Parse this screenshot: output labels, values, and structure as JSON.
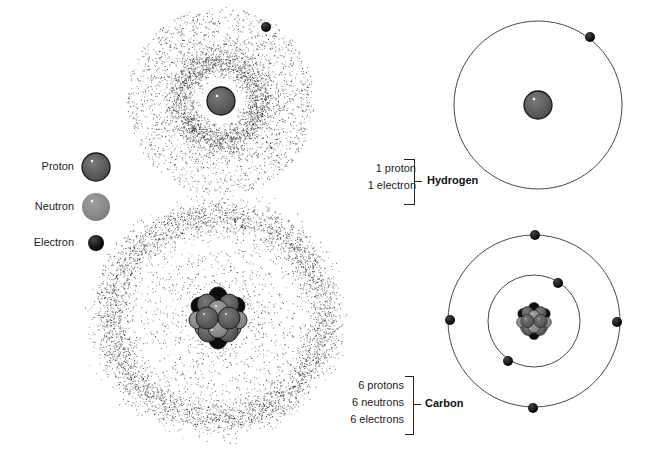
{
  "legend": {
    "items": [
      {
        "label": "Proton",
        "color": "#5a5a5a",
        "stroke": "#1a1a1a"
      },
      {
        "label": "Neutron",
        "color": "#8c8c8c",
        "stroke": "#8c8c8c"
      },
      {
        "label": "Electron",
        "color": "#0a0a0a",
        "stroke": "#000000"
      }
    ]
  },
  "hydrogen": {
    "name": "Hydrogen",
    "lines": [
      "1 proton",
      "1 electron"
    ],
    "protons": 1,
    "neutrons": 0,
    "electrons": 1
  },
  "carbon": {
    "name": "Carbon",
    "lines": [
      "6 protons",
      "6 neutrons",
      "6 electrons"
    ],
    "protons": 6,
    "neutrons": 6,
    "electrons": 6
  },
  "colors": {
    "proton": "#5a5a5a",
    "neutron": "#8c8c8c",
    "electron": "#0a0a0a",
    "orbit": "#333333",
    "cloud_dot": "#222222"
  }
}
